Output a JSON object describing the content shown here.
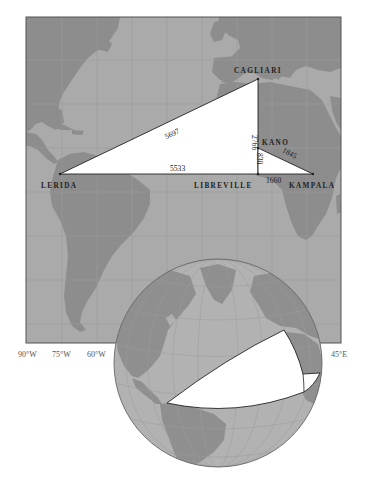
{
  "map": {
    "colors": {
      "ocean": "#aaaaaa",
      "land": "#8d8d8d",
      "grid": "#9a9a9a",
      "frame": "#555555",
      "triangle_fill": "#ffffff",
      "triangle_stroke": "#222222",
      "globe_ocean": "#b2b2b2",
      "globe_land": "#8f8f8f"
    },
    "cities": {
      "cagliari": "CAGLIARI",
      "kano": "KANO",
      "lerida": "LERIDA",
      "libreville": "LIBREVILLE",
      "kampala": "KAMPALA"
    },
    "distances": {
      "lerida_cagliari": "5697",
      "lerida_libreville": "5533",
      "cagliari_kano": "2766",
      "kano_libreville": "830",
      "kano_kampala": "1845",
      "libreville_kampala": "1660"
    },
    "longitude_labels": [
      "90°W",
      "75°W",
      "60°W",
      "45°E"
    ]
  }
}
